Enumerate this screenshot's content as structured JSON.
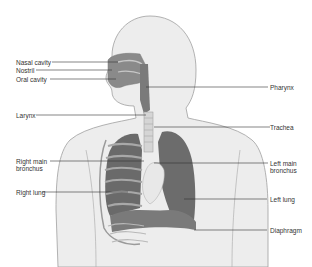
{
  "diagram": {
    "colors": {
      "body": "#ececec",
      "outline": "#9a9a9a",
      "organ": "#6f6f6f",
      "organ_light": "#cfcfcf",
      "line": "#333333"
    },
    "labels_left": [
      {
        "text": "Nasal cavity",
        "y": 59
      },
      {
        "text": "Nostril",
        "y": 67
      },
      {
        "text": "Oral cavity",
        "y": 76
      },
      {
        "text": "Larynx",
        "y": 112
      },
      {
        "text": "Right main",
        "y": 158
      },
      {
        "text": "bronchus",
        "y": 165
      },
      {
        "text": "Right lung",
        "y": 189
      }
    ],
    "labels_right": [
      {
        "text": "Pharynx",
        "y": 84
      },
      {
        "text": "Trachea",
        "y": 124
      },
      {
        "text": "Left main",
        "y": 160
      },
      {
        "text": "bronchus",
        "y": 167
      },
      {
        "text": "Left lung",
        "y": 196
      },
      {
        "text": "Diaphragm",
        "y": 227
      }
    ]
  }
}
